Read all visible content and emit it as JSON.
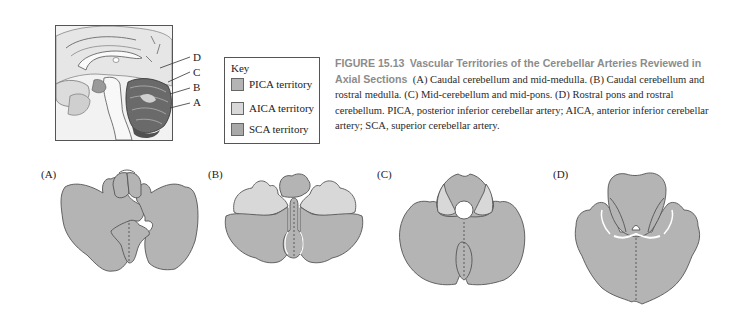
{
  "figure": {
    "number": "FIGURE 15.13",
    "title": "Vascular Territories of the Cerebellar Arteries Reviewed in Axial Sections",
    "caption_text": "(A) Caudal cerebellum and mid-medulla. (B) Caudal cerebellum and rostral medulla. (C) Mid-cerebellum and mid-pons. (D) Rostral pons and rostral cerebellum. PICA, posterior inferior cerebellar artery; AICA, anterior inferior cerebellar artery; SCA, superior cerebellar artery."
  },
  "sagittal_view": {
    "section_labels": [
      "D",
      "C",
      "B",
      "A"
    ]
  },
  "key": {
    "title": "Key",
    "items": [
      {
        "label": "PICA territory",
        "color": "#b4b4b4"
      },
      {
        "label": "AICA territory",
        "color": "#d8d8d8"
      },
      {
        "label": "SCA territory",
        "color": "#a9a9a9"
      }
    ]
  },
  "sections": [
    {
      "label": "(A)",
      "description": "Caudal cerebellum and mid-medulla"
    },
    {
      "label": "(B)",
      "description": "Caudal cerebellum and rostral medulla"
    },
    {
      "label": "(C)",
      "description": "Mid-cerebellum and mid-pons"
    },
    {
      "label": "(D)",
      "description": "Rostral pons and rostral cerebellum"
    }
  ],
  "colors": {
    "pica": "#b4b4b4",
    "aica": "#d8d8d8",
    "sca": "#a9a9a9",
    "outline": "#555555",
    "caption_heading": "#8c8c8c"
  }
}
